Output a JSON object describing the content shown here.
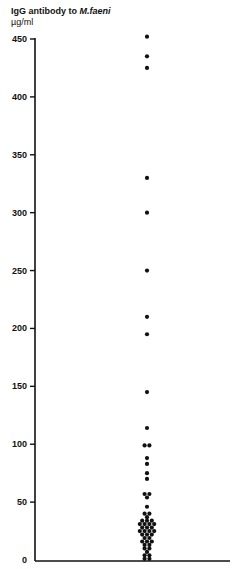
{
  "chart_data": {
    "type": "scatter",
    "title": "IgG antibody to M.faeni",
    "title_plain": "IgG antibody to",
    "title_italic": "M.faeni",
    "ylabel": "µg/ml",
    "xlabel": "",
    "ylim": [
      0,
      450
    ],
    "yticks": [
      0,
      50,
      100,
      150,
      200,
      250,
      300,
      350,
      400,
      450
    ],
    "grid": false,
    "legend": null,
    "points": [
      {
        "x": 0,
        "y": 452
      },
      {
        "x": 0,
        "y": 435
      },
      {
        "x": 0,
        "y": 425
      },
      {
        "x": 0,
        "y": 330
      },
      {
        "x": 0,
        "y": 300
      },
      {
        "x": 0,
        "y": 250
      },
      {
        "x": 0,
        "y": 210
      },
      {
        "x": 0,
        "y": 195
      },
      {
        "x": 0,
        "y": 145
      },
      {
        "x": 0,
        "y": 114
      },
      {
        "x": -1,
        "y": 99
      },
      {
        "x": 1,
        "y": 99
      },
      {
        "x": 0,
        "y": 88
      },
      {
        "x": 0,
        "y": 83
      },
      {
        "x": 0,
        "y": 75
      },
      {
        "x": 0,
        "y": 70
      },
      {
        "x": -1,
        "y": 57
      },
      {
        "x": 1,
        "y": 57
      },
      {
        "x": 0,
        "y": 54
      },
      {
        "x": 0,
        "y": 46
      },
      {
        "x": -1,
        "y": 40
      },
      {
        "x": 1,
        "y": 40
      },
      {
        "x": 0,
        "y": 37
      },
      {
        "x": -2,
        "y": 34
      },
      {
        "x": 0,
        "y": 34
      },
      {
        "x": 2,
        "y": 34
      },
      {
        "x": -3,
        "y": 31
      },
      {
        "x": -1,
        "y": 31
      },
      {
        "x": 1,
        "y": 31
      },
      {
        "x": 3,
        "y": 31
      },
      {
        "x": -2,
        "y": 28
      },
      {
        "x": 0,
        "y": 28
      },
      {
        "x": 2,
        "y": 28
      },
      {
        "x": -3,
        "y": 25
      },
      {
        "x": -1,
        "y": 25
      },
      {
        "x": 1,
        "y": 25
      },
      {
        "x": 3,
        "y": 25
      },
      {
        "x": -2,
        "y": 22
      },
      {
        "x": 0,
        "y": 22
      },
      {
        "x": 2,
        "y": 22
      },
      {
        "x": -1,
        "y": 19
      },
      {
        "x": 1,
        "y": 19
      },
      {
        "x": -2,
        "y": 16
      },
      {
        "x": 0,
        "y": 16
      },
      {
        "x": 2,
        "y": 16
      },
      {
        "x": -1,
        "y": 13
      },
      {
        "x": 1,
        "y": 13
      },
      {
        "x": -1,
        "y": 10
      },
      {
        "x": 1,
        "y": 10
      },
      {
        "x": 0,
        "y": 7
      },
      {
        "x": -1,
        "y": 4
      },
      {
        "x": 1,
        "y": 4
      },
      {
        "x": -1,
        "y": 1
      },
      {
        "x": 1,
        "y": 1
      }
    ]
  },
  "header": {
    "title_plain": "IgG antibody to",
    "title_italic": "M.faeni",
    "unit": "µg/ml"
  }
}
